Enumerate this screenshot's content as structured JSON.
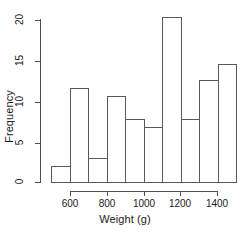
{
  "chart_data": {
    "type": "bar",
    "title": "",
    "subtitle": "",
    "xlabel": "Weight (g)",
    "ylabel": "Frequency",
    "bin_width": 100,
    "bin_edges": [
      500,
      600,
      700,
      800,
      900,
      1000,
      1100,
      1200,
      1300,
      1400,
      1500
    ],
    "categories": [
      "500-600",
      "600-700",
      "700-800",
      "800-900",
      "900-1000",
      "1000-1100",
      "1100-1200",
      "1200-1300",
      "1300-1400",
      "1400-1500"
    ],
    "values": [
      2,
      12,
      3,
      11,
      8,
      7,
      21,
      8,
      13,
      15
    ],
    "xlim": [
      500,
      1500
    ],
    "ylim": [
      0,
      21
    ],
    "xticks": [
      600,
      800,
      1000,
      1200,
      1400
    ],
    "xtick_labels": [
      "600",
      "800",
      "1000",
      "1200",
      "1400"
    ],
    "yticks": [
      0,
      5,
      10,
      15,
      20
    ],
    "ytick_labels": [
      "0",
      "5",
      "10",
      "15",
      "20"
    ],
    "grid": false,
    "legend": null,
    "bar_fill": "#ffffff",
    "bar_edge_color": "#595959",
    "axis_color": "#4d4d4d",
    "background": "#ffffff"
  }
}
